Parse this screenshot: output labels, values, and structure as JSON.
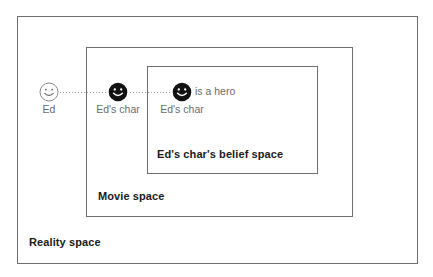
{
  "diagram": {
    "spaces": [
      {
        "id": "reality-space",
        "label": "Reality space"
      },
      {
        "id": "movie-space",
        "label": "Movie space"
      },
      {
        "id": "belief-space",
        "label": "Ed's char's belief space"
      }
    ],
    "agents": [
      {
        "id": "ed",
        "label": "Ed",
        "icon": "smiley-face-outline-icon",
        "style": "outline"
      },
      {
        "id": "eds-char-movie",
        "label": "Ed's char",
        "icon": "smiley-face-solid-icon",
        "style": "solid"
      },
      {
        "id": "eds-char-belief",
        "label": "Ed's char",
        "icon": "smiley-face-solid-icon",
        "style": "solid"
      }
    ],
    "proposition": "is a hero",
    "connectors": [
      {
        "id": "connector-ed-to-movie-char",
        "style": "dotted"
      },
      {
        "id": "connector-movie-char-to-belief-char",
        "style": "dotted"
      }
    ],
    "colors": {
      "box_border": "#6e6e6e",
      "label_text": "#1a1a1a",
      "agent_text": "#6b6b6b",
      "face_solid": "#121212",
      "face_outline_stroke": "#8a8a8a",
      "connector": "#9a9a9a",
      "background": "#ffffff"
    }
  }
}
